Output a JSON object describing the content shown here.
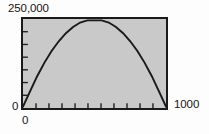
{
  "figure": {
    "background_color": "#fdfdfd",
    "plot_background_color": "#c9c9c9",
    "frame_color": "#1a1a1a",
    "curve_color": "#1a1a1a"
  },
  "labels": {
    "y_max": "250,000",
    "y_min": "0",
    "x_min": "0",
    "x_max": "1000"
  },
  "chart_data": {
    "type": "line",
    "title": "",
    "xlabel": "",
    "ylabel": "",
    "xlim": [
      0,
      1000
    ],
    "ylim": [
      0,
      250000
    ],
    "xticklabels": [
      "0",
      "1000"
    ],
    "yticklabels": [
      "0",
      "250,000"
    ],
    "grid": false,
    "legend": null,
    "x_tick_count": 11,
    "y_tick_count": 7,
    "tick_direction": "in",
    "series": [
      {
        "name": "revenue",
        "equation": "y = x * (1000 - x)",
        "x": [
          0,
          50,
          100,
          150,
          200,
          250,
          300,
          350,
          400,
          450,
          500,
          550,
          600,
          650,
          700,
          750,
          800,
          850,
          900,
          950,
          1000
        ],
        "y": [
          0,
          47500,
          90000,
          127500,
          160000,
          187500,
          210000,
          227500,
          240000,
          247500,
          250000,
          247500,
          240000,
          227500,
          210000,
          187500,
          160000,
          127500,
          90000,
          47500,
          0
        ]
      }
    ]
  }
}
